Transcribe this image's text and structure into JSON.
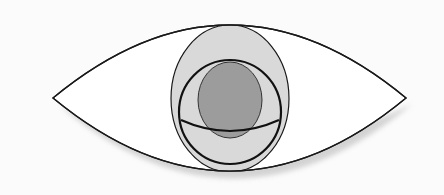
{
  "diagram": {
    "title": "",
    "colors": {
      "background": "#fbfbfb",
      "eye_fill": "#ffffff",
      "stroke": "#1a1a1a",
      "outer_ellipse_fill": "#d9d9d9",
      "inner_ellipse_fill": "#9c9c9c",
      "shadow": "#cfcfcf"
    },
    "shapes": {
      "eye_outline": {
        "left_corner": [
          53,
          98
        ],
        "right_corner": [
          406,
          98
        ],
        "top_y": 25,
        "bottom_y": 172
      },
      "outer_ellipse": {
        "cx": 230,
        "cy": 98.5,
        "rx": 59,
        "ry": 73.5
      },
      "thick_circle": {
        "cx": 230,
        "cy": 112,
        "rx": 51,
        "ry": 52
      },
      "inner_ellipse": {
        "cx": 230,
        "cy": 100,
        "rx": 32,
        "ry": 38
      },
      "horizontal_arc": {
        "start": [
          181,
          120
        ],
        "control": [
          230,
          142
        ],
        "end": [
          279,
          120
        ]
      }
    }
  }
}
